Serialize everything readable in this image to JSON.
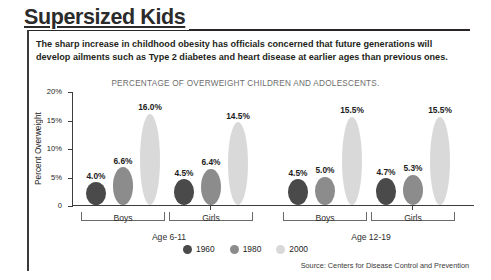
{
  "header": {
    "title": "Supersized Kids",
    "intro": "The sharp increase in childhood obesity has officials concerned that future generations will develop ailments such as Type 2 diabetes and heart disease at earlier ages than previous ones."
  },
  "source": "Source: Centers for Disease Control and Prevention",
  "colors": {
    "series_1960": "#4a4a4a",
    "series_1980": "#8c8c8c",
    "series_2000": "#d9d9d9",
    "axis": "#3d3d3d",
    "text": "#231f20"
  },
  "chart_data": {
    "type": "bar",
    "title": "PERCENTAGE OF OVERWEIGHT CHILDREN AND ADOLESCENTS.",
    "xlabel": "",
    "ylabel": "Percent Overweight",
    "ylim": [
      0,
      20
    ],
    "ytick_labels": [
      "0",
      "5%",
      "10%",
      "15%",
      "20%"
    ],
    "ytick_values": [
      0,
      5,
      10,
      15,
      20
    ],
    "grid": false,
    "legend_position": "bottom-center",
    "categories": [
      "Boys",
      "Girls",
      "Boys",
      "Girls"
    ],
    "groups": [
      {
        "age_label": "Age 6-11",
        "categories": [
          {
            "label": "Boys",
            "bars": [
              {
                "series": "1960",
                "value": 4.0,
                "value_label": "4.0%"
              },
              {
                "series": "1980",
                "value": 6.6,
                "value_label": "6.6%"
              },
              {
                "series": "2000",
                "value": 16.0,
                "value_label": "16.0%"
              }
            ]
          },
          {
            "label": "Girls",
            "bars": [
              {
                "series": "1960",
                "value": 4.5,
                "value_label": "4.5%"
              },
              {
                "series": "1980",
                "value": 6.4,
                "value_label": "6.4%"
              },
              {
                "series": "2000",
                "value": 14.5,
                "value_label": "14.5%"
              }
            ]
          }
        ]
      },
      {
        "age_label": "Age 12-19",
        "categories": [
          {
            "label": "Boys",
            "bars": [
              {
                "series": "1960",
                "value": 4.5,
                "value_label": "4.5%"
              },
              {
                "series": "1980",
                "value": 5.0,
                "value_label": "5.0%"
              },
              {
                "series": "2000",
                "value": 15.5,
                "value_label": "15.5%"
              }
            ]
          },
          {
            "label": "Girls",
            "bars": [
              {
                "series": "1960",
                "value": 4.7,
                "value_label": "4.7%"
              },
              {
                "series": "1980",
                "value": 5.3,
                "value_label": "5.3%"
              },
              {
                "series": "2000",
                "value": 15.5,
                "value_label": "15.5%"
              }
            ]
          }
        ]
      }
    ],
    "series": [
      {
        "name": "1960",
        "color": "#4a4a4a",
        "values": [
          4.0,
          4.5,
          4.5,
          4.7
        ]
      },
      {
        "name": "1980",
        "color": "#8c8c8c",
        "values": [
          6.6,
          6.4,
          5.0,
          5.3
        ]
      },
      {
        "name": "2000",
        "color": "#d9d9d9",
        "values": [
          16.0,
          14.5,
          15.5,
          15.5
        ]
      }
    ],
    "legend": [
      {
        "label": "1960",
        "color": "#4a4a4a"
      },
      {
        "label": "1980",
        "color": "#8c8c8c"
      },
      {
        "label": "2000",
        "color": "#d9d9d9"
      }
    ]
  }
}
